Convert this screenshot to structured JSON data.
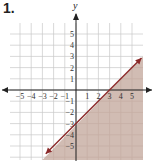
{
  "problem_number": "1.",
  "chart_data": {
    "type": "line",
    "title": "",
    "xlabel": "",
    "ylabel": "y",
    "xlim": [
      -6,
      6
    ],
    "ylim": [
      -6,
      6
    ],
    "x_ticks": [
      -5,
      -4,
      -3,
      -2,
      -1,
      1,
      2,
      3,
      4,
      5
    ],
    "y_ticks": [
      5,
      4,
      3,
      2,
      1,
      -1,
      -2,
      -3,
      -4,
      -5
    ],
    "grid": true,
    "series": [
      {
        "name": "boundary line y = x - 3",
        "style": "solid",
        "color": "#8b2a2a",
        "points": [
          [
            -3,
            -6
          ],
          [
            0,
            -3
          ],
          [
            3,
            0
          ],
          [
            6,
            3
          ]
        ]
      }
    ],
    "shaded_region": {
      "description": "below/right of line (y <= x - 3)",
      "color": "#c9b0a6"
    },
    "annotations": []
  },
  "colors": {
    "line": "#8b2a2a",
    "shade": "#c9b0a6",
    "grid": "#c8c8c8",
    "axis": "#222222"
  }
}
